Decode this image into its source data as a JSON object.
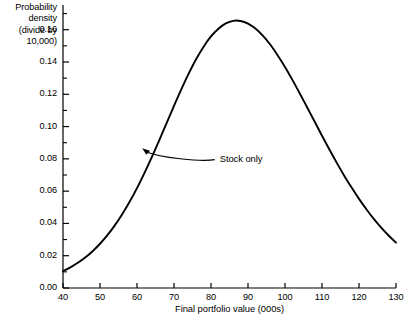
{
  "chart_data": {
    "type": "line",
    "title": "",
    "xlabel": "Final portfolio value (000s)",
    "ylabel": "Probability\ndensity\n(divide by\n10,000)",
    "ylabel_lines": [
      "Probability",
      "density",
      "(divide by",
      "10,000)"
    ],
    "xlim": [
      40,
      130
    ],
    "ylim": [
      0.0,
      0.1753
    ],
    "grid": false,
    "legend": null,
    "xticks": [
      40,
      50,
      60,
      70,
      80,
      90,
      100,
      110,
      120,
      130
    ],
    "xtick_labels": [
      "40",
      "50",
      "60",
      "70",
      "80",
      "90",
      "100",
      "110",
      "120",
      "130"
    ],
    "yticks": [
      0.0,
      0.02,
      0.04,
      0.06,
      0.08,
      0.1,
      0.12,
      0.14,
      0.16
    ],
    "ytick_labels": [
      "0.00",
      "0.02",
      "0.04",
      "0.06",
      "0.08",
      "0.10",
      "0.12",
      "0.14",
      "0.16"
    ],
    "y_minor_ticks": [
      0.01,
      0.03,
      0.05,
      0.07,
      0.09,
      0.11,
      0.13,
      0.15,
      0.17
    ],
    "series": [
      {
        "name": "Stock only",
        "color": "#000000",
        "x": [
          40,
          42,
          44,
          46,
          48,
          50,
          52,
          54,
          56,
          58,
          60,
          62,
          64,
          66,
          68,
          70,
          72,
          74,
          76,
          78,
          80,
          82,
          84,
          86,
          88,
          90,
          92,
          94,
          96,
          98,
          100,
          102,
          104,
          106,
          108,
          110,
          112,
          114,
          116,
          118,
          120,
          122,
          124,
          126,
          128,
          130
        ],
        "y": [
          0.0105,
          0.0128,
          0.0156,
          0.0189,
          0.0228,
          0.0274,
          0.0327,
          0.0388,
          0.0457,
          0.0534,
          0.0619,
          0.0712,
          0.0811,
          0.0915,
          0.1022,
          0.1128,
          0.1232,
          0.1329,
          0.1418,
          0.1495,
          0.1558,
          0.1606,
          0.1639,
          0.1655,
          0.1654,
          0.1638,
          0.1607,
          0.1563,
          0.1508,
          0.1442,
          0.1369,
          0.1289,
          0.1205,
          0.1118,
          0.1031,
          0.0943,
          0.0858,
          0.0775,
          0.0696,
          0.0622,
          0.0552,
          0.0488,
          0.0428,
          0.0374,
          0.0325,
          0.0281
        ]
      }
    ],
    "annotations": [
      {
        "text": "Stock only",
        "text_x": 81,
        "text_y": 0.0795,
        "target_x": 61,
        "target_y": 0.0875
      }
    ]
  },
  "axes": {
    "y_title": "Probability\ndensity\n(divide by\n10,000)",
    "x_title": "Final portfolio value (000s)"
  }
}
